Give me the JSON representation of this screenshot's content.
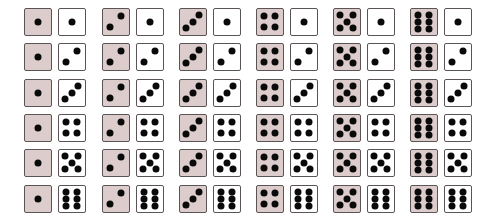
{
  "colors": {
    "first_die": "#dccccb",
    "second_die": "#ffffff",
    "pip": "#0a0a0a",
    "border": "#5a5456"
  },
  "layout": {
    "columns_x": [
      24,
      102,
      179,
      256,
      333,
      410
    ],
    "rows_y": [
      8,
      43,
      79,
      114,
      149,
      185
    ],
    "die_size": 28,
    "pair_gap": 34
  },
  "grid": {
    "rows": [
      {
        "pairs": [
          [
            1,
            1
          ],
          [
            2,
            1
          ],
          [
            3,
            1
          ],
          [
            4,
            1
          ],
          [
            5,
            1
          ],
          [
            6,
            1
          ]
        ]
      },
      {
        "pairs": [
          [
            1,
            2
          ],
          [
            2,
            2
          ],
          [
            3,
            2
          ],
          [
            4,
            2
          ],
          [
            5,
            2
          ],
          [
            6,
            2
          ]
        ]
      },
      {
        "pairs": [
          [
            1,
            3
          ],
          [
            2,
            3
          ],
          [
            3,
            3
          ],
          [
            4,
            3
          ],
          [
            5,
            3
          ],
          [
            6,
            3
          ]
        ]
      },
      {
        "pairs": [
          [
            1,
            4
          ],
          [
            2,
            4
          ],
          [
            3,
            4
          ],
          [
            4,
            4
          ],
          [
            5,
            4
          ],
          [
            6,
            4
          ]
        ]
      },
      {
        "pairs": [
          [
            1,
            5
          ],
          [
            2,
            5
          ],
          [
            3,
            5
          ],
          [
            4,
            5
          ],
          [
            5,
            5
          ],
          [
            6,
            5
          ]
        ]
      },
      {
        "pairs": [
          [
            1,
            6
          ],
          [
            2,
            6
          ],
          [
            3,
            6
          ],
          [
            4,
            6
          ],
          [
            5,
            6
          ],
          [
            6,
            6
          ]
        ]
      }
    ]
  }
}
